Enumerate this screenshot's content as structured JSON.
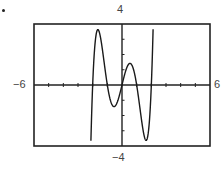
{
  "labels": {
    "ymax": "4",
    "ymin": "−4",
    "xmin": "−6",
    "xmax": "6"
  },
  "chart_data": {
    "type": "line",
    "title": "",
    "xlabel": "",
    "ylabel": "",
    "xlim": [
      -6,
      6
    ],
    "ylim": [
      -4,
      4
    ],
    "xticks_step": 1,
    "yticks_step": 1,
    "grid": false,
    "function": "y = x^5 - 5x^3 + 4x",
    "series": [
      {
        "name": "f(x)",
        "x": [
          -2.0,
          -1.9,
          -1.8,
          -1.7,
          -1.6,
          -1.57,
          -1.5,
          -1.4,
          -1.3,
          -1.2,
          -1.1,
          -1.0,
          -0.9,
          -0.8,
          -0.7,
          -0.6,
          -0.55,
          -0.5,
          -0.4,
          -0.3,
          -0.2,
          -0.1,
          0.0,
          0.1,
          0.2,
          0.3,
          0.4,
          0.5,
          0.55,
          0.6,
          0.7,
          0.8,
          0.9,
          1.0,
          1.1,
          1.2,
          1.3,
          1.4,
          1.5,
          1.57,
          1.6,
          1.7,
          1.8,
          1.9,
          2.0
        ],
        "y": [
          0.0,
          2.05,
          3.09,
          3.4,
          3.28,
          3.53,
          2.73,
          1.84,
          0.82,
          -0.09,
          -0.73,
          0.0,
          0.74,
          1.34,
          1.66,
          1.71,
          1.42,
          1.41,
          1.09,
          0.83,
          0.76,
          0.39,
          0.0,
          -0.39,
          -0.76,
          -0.83,
          -1.09,
          -1.41,
          -1.42,
          -1.71,
          -1.66,
          -1.34,
          -0.74,
          0.0,
          0.73,
          0.09,
          -0.82,
          -1.84,
          -2.73,
          -3.53,
          -3.28,
          -3.4,
          -3.09,
          -2.05,
          0.0
        ]
      }
    ],
    "annotations": [
      "4",
      "-4",
      "-6",
      "6"
    ]
  }
}
